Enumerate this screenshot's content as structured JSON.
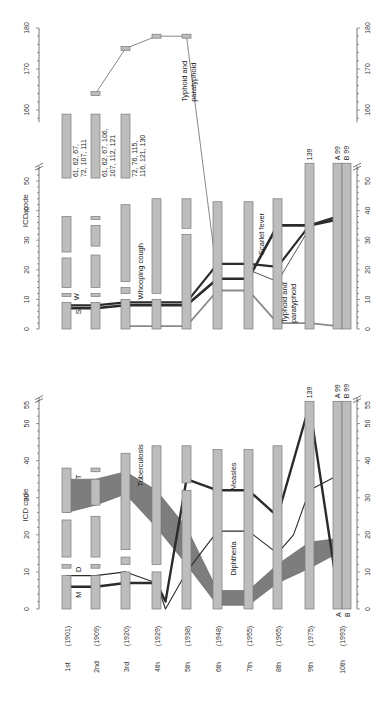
{
  "chart_data": {
    "type": "diagram-flow",
    "orientation": "rotated-90-ccw",
    "revisions": [
      {
        "label": "1st",
        "year": "(1901)"
      },
      {
        "label": "2nd",
        "year": "(1909)"
      },
      {
        "label": "3rd",
        "year": "(1920)"
      },
      {
        "label": "4th",
        "year": "(1929)"
      },
      {
        "label": "5th",
        "year": "(1938)"
      },
      {
        "label": "6th",
        "year": "(1948)"
      },
      {
        "label": "7th",
        "year": "(1955)"
      },
      {
        "label": "8th",
        "year": "(1965)"
      },
      {
        "label": "9th",
        "year": "(1975)"
      },
      {
        "label": "10th",
        "year": "(1993)"
      }
    ],
    "panels": [
      {
        "id": "upper",
        "ylabel": "ICD code",
        "axis_ticks_low": [
          0,
          10,
          20,
          30,
          40,
          50
        ],
        "axis_ticks_high": [
          160,
          170,
          180
        ],
        "axis_break_between": [
          55,
          157
        ],
        "ylim_low": [
          0,
          55
        ],
        "ylim_high": [
          157,
          180
        ],
        "code_blocks": [
          [
            [
              0,
              9
            ],
            [
              11,
              12
            ],
            [
              14,
              24
            ],
            [
              26,
              38
            ]
          ],
          [
            [
              0,
              9
            ],
            [
              11,
              12
            ],
            [
              14,
              25
            ],
            [
              28,
              35
            ],
            [
              37,
              38
            ]
          ],
          [
            [
              0,
              10
            ],
            [
              12,
              14
            ],
            [
              16,
              42
            ]
          ],
          [
            [
              0,
              10
            ],
            [
              12,
              44
            ]
          ],
          [
            [
              0,
              32
            ],
            [
              34,
              44
            ]
          ],
          [
            [
              0,
              43
            ]
          ],
          [
            [
              0,
              43
            ]
          ],
          [
            [
              0,
              44
            ]
          ],
          [
            [
              0,
              56
            ]
          ],
          [
            [
              0,
              56
            ]
          ]
        ],
        "high_blocks": [
          {
            "rev": 1,
            "range": [
              51,
              159
            ],
            "note": "61, 62, 67, 72, 107, 111"
          },
          {
            "rev": 2,
            "range": [
              51,
              159
            ],
            "note": "61, 62, 67, 106, 107, 112, 121"
          },
          {
            "rev": 3,
            "range": [
              51,
              159
            ],
            "note": "72, 76, 115, 116, 121, 130"
          }
        ],
        "column_labels": [
          {
            "rev": 9,
            "text": "139"
          },
          {
            "rev": 10,
            "text": "A 99"
          },
          {
            "rev": 10.3,
            "text": "B 99"
          }
        ],
        "flows": [
          {
            "name": "Typhoid and paratyphoid (upper)",
            "points": [
              [
                2,
                164
              ],
              [
                3,
                175
              ],
              [
                4,
                178
              ],
              [
                5,
                178
              ],
              [
                6,
                17
              ]
            ],
            "style": "thin"
          },
          {
            "name": "Whooping cough",
            "points": [
              [
                1,
                8
              ],
              [
                2,
                8
              ],
              [
                3,
                9
              ],
              [
                4,
                9
              ],
              [
                5,
                9
              ],
              [
                6,
                22
              ],
              [
                7,
                22
              ],
              [
                8,
                21
              ],
              [
                9,
                35
              ],
              [
                10,
                38
              ]
            ]
          },
          {
            "name": "Scarlet fever",
            "points": [
              [
                1,
                7
              ],
              [
                2,
                7
              ],
              [
                3,
                8
              ],
              [
                4,
                8
              ],
              [
                5,
                8
              ],
              [
                6,
                17
              ],
              [
                7,
                17
              ],
              [
                8,
                35
              ],
              [
                9,
                35
              ],
              [
                10,
                37
              ]
            ]
          },
          {
            "name": "Typhoid and paratyphoid",
            "points": [
              [
                3,
                1
              ],
              [
                4,
                1
              ],
              [
                5,
                1
              ],
              [
                6,
                13
              ],
              [
                7,
                13
              ],
              [
                8,
                2
              ],
              [
                9,
                2
              ],
              [
                10,
                1
              ]
            ]
          },
          {
            "name": "branch",
            "points": [
              [
                7,
                20
              ],
              [
                8,
                16
              ],
              [
                9,
                34
              ]
            ],
            "style": "thin"
          }
        ],
        "annotations": [
          {
            "text": "S",
            "rev": 1.4,
            "code": 6
          },
          {
            "text": "W",
            "rev": 1.4,
            "code": 10
          },
          {
            "text": "Whooping cough",
            "rev": 3.5,
            "code": 18
          },
          {
            "text": "Scarlet fever",
            "rev": 8.5,
            "code": 30
          },
          {
            "text": "Typhoid and paratyphoid",
            "rev": 8.5,
            "code": 6
          },
          {
            "text": "Typhoid and paratyphoid",
            "rev": 5.5,
            "code": 172
          }
        ]
      },
      {
        "id": "lower",
        "ylabel": "ICD code",
        "axis_ticks": [
          0,
          10,
          20,
          30,
          40,
          50,
          55
        ],
        "ylim": [
          0,
          57
        ],
        "code_blocks": [
          [
            [
              0,
              9
            ],
            [
              11,
              12
            ],
            [
              14,
              24
            ],
            [
              26,
              38
            ]
          ],
          [
            [
              0,
              9
            ],
            [
              11,
              12
            ],
            [
              14,
              25
            ],
            [
              28,
              35
            ],
            [
              37,
              38
            ]
          ],
          [
            [
              0,
              10
            ],
            [
              12,
              14
            ],
            [
              16,
              42
            ]
          ],
          [
            [
              0,
              10
            ],
            [
              12,
              44
            ]
          ],
          [
            [
              0,
              32
            ],
            [
              34,
              44
            ]
          ],
          [
            [
              0,
              43
            ]
          ],
          [
            [
              0,
              43
            ]
          ],
          [
            [
              0,
              44
            ]
          ],
          [
            [
              0,
              56
            ]
          ],
          [
            [
              0,
              56
            ]
          ]
        ],
        "column_labels": [
          {
            "rev": 9,
            "text": "139"
          },
          {
            "rev": 10,
            "text": "A 99"
          },
          {
            "rev": 10.3,
            "text": "B 99"
          },
          {
            "rev": 10,
            "text": "A",
            "bottom": true
          },
          {
            "rev": 10.3,
            "text": "B",
            "bottom": true
          }
        ],
        "bands": [
          {
            "name": "Tuberculosis",
            "points": [
              [
                1,
                26,
                35
              ],
              [
                2,
                28,
                35
              ],
              [
                3,
                31,
                37
              ],
              [
                4,
                22,
                32
              ],
              [
                5,
                12,
                22
              ],
              [
                6,
                1,
                5
              ],
              [
                7,
                1,
                5
              ],
              [
                8,
                7,
                12
              ],
              [
                9,
                11,
                18
              ],
              [
                10,
                15,
                19
              ]
            ]
          }
        ],
        "flows": [
          {
            "name": "Measles",
            "points": [
              [
                1,
                6
              ],
              [
                2,
                6
              ],
              [
                3,
                7
              ],
              [
                4,
                7
              ],
              [
                4.3,
                2
              ],
              [
                5,
                35
              ],
              [
                6,
                32
              ],
              [
                7,
                32
              ],
              [
                8,
                25
              ],
              [
                9,
                55
              ],
              [
                10,
                5
              ]
            ]
          },
          {
            "name": "Diphtheria",
            "points": [
              [
                1,
                9
              ],
              [
                2,
                9
              ],
              [
                3,
                10
              ],
              [
                4,
                7
              ],
              [
                4.3,
                0
              ],
              [
                5,
                10
              ],
              [
                6,
                21
              ],
              [
                7,
                21
              ],
              [
                8,
                15
              ],
              [
                8.5,
                20
              ],
              [
                9,
                32
              ],
              [
                10,
                36
              ]
            ],
            "style": "thin"
          }
        ],
        "annotations": [
          {
            "text": "M",
            "rev": 1.4,
            "code": 4
          },
          {
            "text": "D",
            "rev": 1.4,
            "code": 10
          },
          {
            "text": "T",
            "rev": 1.4,
            "code": 37
          },
          {
            "text": "Tuberculosis",
            "rev": 3.5,
            "code": 38
          },
          {
            "text": "Measles",
            "rev": 6.5,
            "code": 35
          },
          {
            "text": "Diphtheria",
            "rev": 6.5,
            "code": 15
          }
        ]
      }
    ],
    "axis_title": "ICD code"
  },
  "labels": {
    "ylabel_upper": "ICD code",
    "ylabel_lower": "ICD code",
    "upper_high_notes": [
      [
        "61, 62, 67,",
        "72, 107, 111"
      ],
      [
        "61, 62, 67, 106,",
        "107, 112, 121"
      ],
      [
        "72, 76, 115,",
        "116, 121, 130"
      ]
    ],
    "col9_top": "139",
    "col10a_top": "A 99",
    "col10b_top": "B 99",
    "col10a_bottom": "A",
    "col10b_bottom": "B",
    "ann_S": "S",
    "ann_W": "W",
    "ann_M": "M",
    "ann_D": "D",
    "ann_T": "T",
    "ann_whooping": "Whooping cough",
    "ann_scarlet": "Scarlet fever",
    "ann_typhoid_l1": "Typhoid and",
    "ann_typhoid_l2": "paratyphoid",
    "ann_tuberculosis": "Tuberculosis",
    "ann_measles": "Measles",
    "ann_diphtheria": "Diphtheria"
  },
  "colors": {
    "block_fill": "#bdbdbd",
    "block_stroke": "#7a7a7a",
    "band_fill": "#7d7d7d",
    "flow_dark": "#2b2b2b",
    "flow_mid": "#555555",
    "flow_gray": "#8a8a8a",
    "axis": "#555555"
  }
}
